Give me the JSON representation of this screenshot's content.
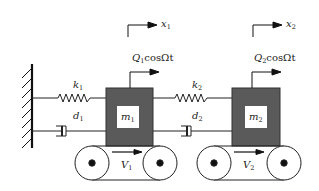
{
  "diagram": {
    "type": "two-mass spring-damper system on moving belts",
    "wall": {
      "label": ""
    },
    "masses": [
      {
        "id": "m1",
        "label": "m",
        "sub": "1",
        "color": "#5a5a5a"
      },
      {
        "id": "m2",
        "label": "m",
        "sub": "2",
        "color": "#5a5a5a"
      }
    ],
    "springs": [
      {
        "id": "k1",
        "label": "k",
        "sub": "1"
      },
      {
        "id": "k2",
        "label": "k",
        "sub": "2"
      }
    ],
    "dampers": [
      {
        "id": "d1",
        "label": "d",
        "sub": "1"
      },
      {
        "id": "d2",
        "label": "d",
        "sub": "2"
      }
    ],
    "displacements": [
      {
        "id": "x1",
        "label": "x",
        "sub": "1"
      },
      {
        "id": "x2",
        "label": "x",
        "sub": "2"
      }
    ],
    "forces": [
      {
        "id": "Q1",
        "label": "Q",
        "sub": "1",
        "tail": "cosΩt"
      },
      {
        "id": "Q2",
        "label": "Q",
        "sub": "2",
        "tail": "cosΩt"
      }
    ],
    "belts": [
      {
        "id": "V1",
        "label": "V",
        "sub": "1"
      },
      {
        "id": "V2",
        "label": "V",
        "sub": "2"
      }
    ]
  }
}
